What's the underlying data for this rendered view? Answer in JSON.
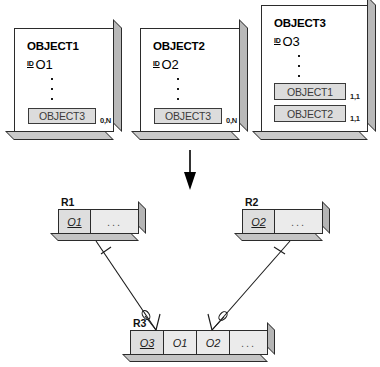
{
  "diagram": {
    "transform_arrow": "down-arrow",
    "object_cards": [
      {
        "name": "OBJECT1",
        "id_tag": "ID",
        "id_value": "O1",
        "ellipsis": "vertical-dots",
        "attributes": [
          {
            "label": "OBJECT3",
            "cardinality": "0,N"
          }
        ]
      },
      {
        "name": "OBJECT2",
        "id_tag": "ID",
        "id_value": "O2",
        "ellipsis": "vertical-dots",
        "attributes": [
          {
            "label": "OBJECT3",
            "cardinality": "0,N"
          }
        ]
      },
      {
        "name": "OBJECT3",
        "id_tag": "ID",
        "id_value": "O3",
        "ellipsis": "vertical-dots",
        "attributes": [
          {
            "label": "OBJECT1",
            "cardinality": "1,1"
          },
          {
            "label": "OBJECT2",
            "cardinality": "1,1"
          }
        ]
      }
    ],
    "relations": [
      {
        "name": "R1",
        "columns": [
          {
            "value": "O1",
            "key": true
          },
          {
            "value": "...",
            "key": false
          }
        ]
      },
      {
        "name": "R2",
        "columns": [
          {
            "value": "O2",
            "key": true
          },
          {
            "value": "...",
            "key": false
          }
        ]
      },
      {
        "name": "R3",
        "columns": [
          {
            "value": "O3",
            "key": true
          },
          {
            "value": "O1",
            "key": false
          },
          {
            "value": "O2",
            "key": false
          },
          {
            "value": "...",
            "key": false
          }
        ]
      }
    ],
    "connectors": [
      {
        "from": "R1",
        "to": "R3",
        "from_end": "one-tick",
        "to_end": "crows-foot-optional"
      },
      {
        "from": "R2",
        "to": "R3",
        "from_end": "one-tick",
        "to_end": "crows-foot-optional"
      }
    ],
    "colors": {
      "card_face": "#ffffff",
      "card_shade": "#b9b9b9",
      "attribute_fill": "#dcdcdc",
      "table_fill": "#e8e8e8",
      "table_key_fill": "#dedede",
      "stroke": "#2b2b2b"
    }
  }
}
